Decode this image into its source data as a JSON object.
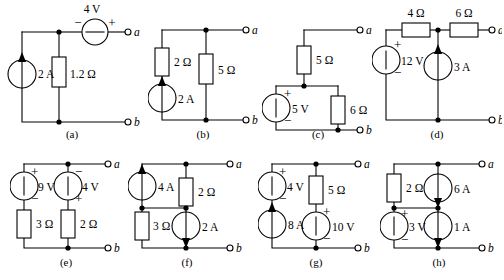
{
  "figure": {
    "terminal_top": "a",
    "terminal_bottom": "b",
    "ohm": "Ω",
    "plus": "+",
    "minus": "−"
  },
  "circuits": [
    {
      "id": "a",
      "label": "(a)",
      "components": {
        "source_v_top": "4 V",
        "source_i_left": "2 A",
        "resistor_mid": "1.2 Ω"
      },
      "polarity": {
        "source_v_top_left": "−",
        "source_v_top_right": "+"
      },
      "current_direction": "up"
    },
    {
      "id": "b",
      "label": "(b)",
      "components": {
        "resistor_left": "2 Ω",
        "source_i_left": "2 A",
        "resistor_mid": "5 Ω"
      },
      "current_direction": "up"
    },
    {
      "id": "c",
      "label": "(c)",
      "components": {
        "resistor_top": "5 Ω",
        "source_v_left": "5 V",
        "resistor_right": "6 Ω"
      },
      "polarity": {
        "source_v_left_top": "+",
        "source_v_left_bottom": "−"
      }
    },
    {
      "id": "d",
      "label": "(d)",
      "components": {
        "resistor_top_left": "4 Ω",
        "resistor_top_right": "6 Ω",
        "source_v_left": "12 V",
        "source_i_mid": "3 A"
      },
      "polarity": {
        "source_v_left_top": "+",
        "source_v_left_bottom": "−"
      },
      "current_direction": "up"
    },
    {
      "id": "e",
      "label": "(e)",
      "components": {
        "source_v_left": "9 V",
        "resistor_left": "3 Ω",
        "source_v_mid": "4 V",
        "resistor_mid": "2 Ω"
      },
      "polarity": {
        "source_v_left_top": "+",
        "source_v_left_bottom": "−",
        "source_v_mid_top": "−",
        "source_v_mid_bottom": "+"
      }
    },
    {
      "id": "f",
      "label": "(f)",
      "components": {
        "source_i_left": "4 A",
        "resistor_left": "3 Ω",
        "resistor_right": "2 Ω",
        "source_i_right": "2 A"
      },
      "current_direction_left": "up",
      "current_direction_right": "down"
    },
    {
      "id": "g",
      "label": "(g)",
      "components": {
        "source_v_left": "4 V",
        "source_i_left": "8 A",
        "resistor_right": "5 Ω",
        "source_v_right": "10 V"
      },
      "polarity": {
        "source_v_left_top": "+",
        "source_v_left_bottom": "−",
        "source_v_right_top": "+",
        "source_v_right_bottom": "−"
      },
      "current_direction_left": "up"
    },
    {
      "id": "h",
      "label": "(h)",
      "components": {
        "resistor_left": "2 Ω",
        "source_v_left": "3 V",
        "source_i_top": "6 A",
        "source_i_bottom": "1 A"
      },
      "polarity": {
        "source_v_left_top": "+",
        "source_v_left_bottom": "−"
      },
      "current_direction_top": "down",
      "current_direction_bottom": "down"
    }
  ]
}
